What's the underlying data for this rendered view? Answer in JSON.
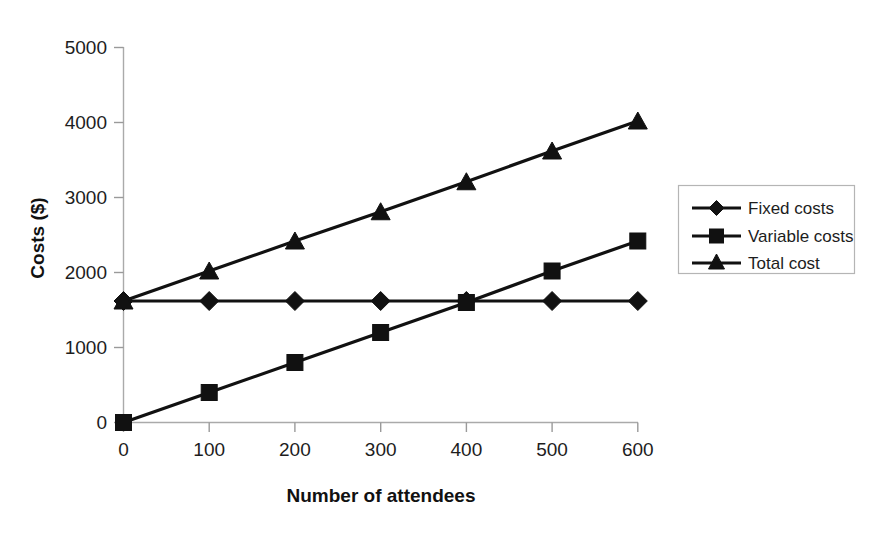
{
  "chart_data": {
    "type": "line",
    "title": "",
    "xlabel": "Number of attendees",
    "ylabel": "Costs ($)",
    "x": [
      0,
      100,
      200,
      300,
      400,
      500,
      600
    ],
    "xlim": [
      0,
      600
    ],
    "ylim": [
      0,
      5000
    ],
    "x_ticks": [
      "0",
      "100",
      "200",
      "300",
      "400",
      "500",
      "600"
    ],
    "y_ticks": [
      "0",
      "1000",
      "2000",
      "3000",
      "4000",
      "5000"
    ],
    "grid": false,
    "legend_position": "right",
    "series": [
      {
        "name": "Fixed costs",
        "marker": "diamond",
        "values": [
          1620,
          1620,
          1620,
          1620,
          1620,
          1620,
          1620
        ]
      },
      {
        "name": "Variable costs",
        "marker": "square",
        "values": [
          0,
          400,
          800,
          1200,
          1600,
          2020,
          2420
        ]
      },
      {
        "name": "Total cost",
        "marker": "triangle",
        "values": [
          1620,
          2020,
          2420,
          2810,
          3210,
          3620,
          4020
        ]
      }
    ]
  },
  "axes": {
    "y_title": "Costs ($)",
    "x_title": "Number of attendees",
    "y_tick_labels": [
      "5000",
      "4000",
      "3000",
      "2000",
      "1000",
      "0"
    ],
    "x_tick_labels": [
      "0",
      "100",
      "200",
      "300",
      "400",
      "500",
      "600"
    ]
  },
  "legend": {
    "entries": [
      {
        "label": "Fixed costs",
        "marker": "diamond-marker-icon"
      },
      {
        "label": "Variable costs",
        "marker": "square-marker-icon"
      },
      {
        "label": "Total cost",
        "marker": "triangle-marker-icon"
      }
    ]
  },
  "colors": {
    "series": "#111111",
    "axis": "#aaaaaa",
    "background": "#ffffff",
    "legend_border": "#b5b5b5"
  }
}
